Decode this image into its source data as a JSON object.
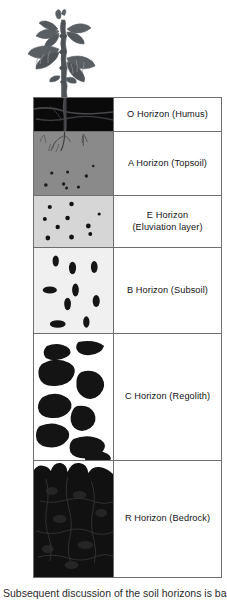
{
  "figure": {
    "background_color": "#ffffff",
    "border_color": "#6e6e6e",
    "caption_partial": "Subsequent discussion of the soil horizons is based on"
  },
  "plant": {
    "name": "plant-illustration",
    "color": "#555a5e",
    "description": "leafy plant above ground with roots extending into soil"
  },
  "soil_profile": {
    "column_headers": [
      "soil-visual",
      "horizon-label"
    ],
    "horizons": [
      {
        "code": "O",
        "label": "O Horizon (Humus)",
        "label_line1": "O Horizon (Humus)",
        "label_line2": "",
        "fill_color": "#0a0a0a",
        "top": 0,
        "height": 33
      },
      {
        "code": "A",
        "label": "A Horizon (Topsoil)",
        "label_line1": "A Horizon (Topsoil)",
        "label_line2": "",
        "fill_color": "#8a8a8a",
        "top": 33,
        "height": 64
      },
      {
        "code": "E",
        "label": "E Horizon (Eluviation layer)",
        "label_line1": "E Horizon",
        "label_line2": "(Eluviation layer)",
        "fill_color": "#d6d6d6",
        "top": 97,
        "height": 52
      },
      {
        "code": "B",
        "label": "B Horizon (Subsoil)",
        "label_line1": "B Horizon (Subsoil)",
        "label_line2": "",
        "fill_color": "#f0f0f0",
        "top": 149,
        "height": 86
      },
      {
        "code": "C",
        "label": "C Horizon (Regolith)",
        "label_line1": "C Horizon (Regolith)",
        "label_line2": "",
        "fill_color": "#ffffff",
        "top": 235,
        "height": 127
      },
      {
        "code": "R",
        "label": "R Horizon (Bedrock)",
        "label_line1": "R Horizon (Bedrock)",
        "label_line2": "",
        "fill_color": "#111111",
        "top": 362,
        "height": 118
      }
    ]
  }
}
